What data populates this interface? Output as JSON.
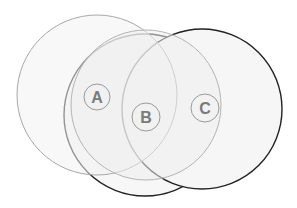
{
  "diagram": {
    "type": "overlapping-circles",
    "background": "#ffffff",
    "circles": [
      {
        "id": "back-middle",
        "cx": 145,
        "cy": 115,
        "r": 81,
        "fill": "#f7f7f7",
        "stroke": "#222222",
        "stroke_width": 1.4
      },
      {
        "id": "right",
        "cx": 202,
        "cy": 109,
        "r": 80,
        "fill": "#f6f6f6",
        "stroke": "#222222",
        "stroke_width": 1.4
      },
      {
        "id": "left",
        "cx": 97,
        "cy": 95,
        "r": 80,
        "fill": "#f3f3f3",
        "stroke": "#a8a8a8",
        "stroke_width": 1
      },
      {
        "id": "center-light",
        "cx": 146,
        "cy": 105,
        "r": 75,
        "fill": "#eeeeee",
        "stroke": "#b4b4b4",
        "stroke_width": 1
      }
    ],
    "labels": [
      {
        "text": "A",
        "cx": 97,
        "cy": 97,
        "r": 13
      },
      {
        "text": "B",
        "cx": 146,
        "cy": 117,
        "r": 14
      },
      {
        "text": "C",
        "cx": 205,
        "cy": 108,
        "r": 14
      }
    ],
    "label_style": {
      "text_color": "#7a7a7a",
      "ring_color": "#9a9a9a",
      "ring_fill": "#f2f2f2",
      "font_size": 16
    }
  }
}
